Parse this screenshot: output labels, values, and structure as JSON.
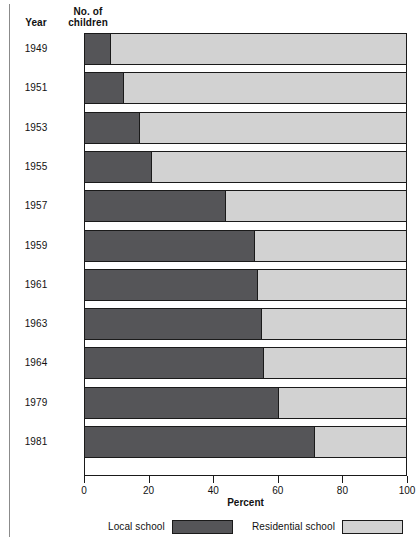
{
  "table_headers": {
    "year": "Year",
    "count_line1": "No. of",
    "count_line2": "children"
  },
  "axis": {
    "title": "Percent",
    "ticks": [
      "0",
      "20",
      "40",
      "60",
      "80",
      "100"
    ]
  },
  "legend": {
    "local_label": "Local school",
    "residential_label": "Residential school"
  },
  "colors": {
    "local": "#555558",
    "residential": "#d2d2d2",
    "outline": "#1a1a1a",
    "background": "#ffffff"
  },
  "rows": [
    {
      "year": "1949",
      "children": "5,818",
      "local": 8.0,
      "residential": 92.0
    },
    {
      "year": "1951",
      "children": "5,676",
      "local": 12.0,
      "residential": 88.0
    },
    {
      "year": "1953",
      "children": "6,284",
      "local": 17.0,
      "residential": 83.0
    },
    {
      "year": "1955",
      "children": "7,333",
      "local": 21.0,
      "residential": 79.0
    },
    {
      "year": "1957",
      "children": "11,157",
      "local": 44.0,
      "residential": 56.0
    },
    {
      "year": "1959",
      "children": "13,375",
      "local": 53.0,
      "residential": 47.0
    },
    {
      "year": "1961",
      "children": "15,802",
      "local": 54.0,
      "residential": 46.0
    },
    {
      "year": "1963",
      "children": "17,091",
      "local": 55.0,
      "residential": 45.0
    },
    {
      "year": "1964",
      "children": "17,852",
      "local": 55.7,
      "residential": 44.3
    },
    {
      "year": "1979",
      "children": "31,161",
      "local": 60.5,
      "residential": 39.5
    },
    {
      "year": "1981",
      "children": "34,050",
      "local": 71.5,
      "residential": 28.5
    }
  ],
  "chart_data": {
    "type": "bar",
    "orientation": "horizontal",
    "stacked": true,
    "normalized": true,
    "title": "",
    "xlabel": "Percent",
    "ylabel": "Year",
    "xlim": [
      0,
      100
    ],
    "xticks": [
      0,
      20,
      40,
      60,
      80,
      100
    ],
    "grid": false,
    "legend_position": "bottom",
    "categories": [
      "1949",
      "1951",
      "1953",
      "1955",
      "1957",
      "1959",
      "1961",
      "1963",
      "1964",
      "1979",
      "1981"
    ],
    "extra_column": {
      "name": "No. of children",
      "values": [
        5818,
        5676,
        6284,
        7333,
        11157,
        13375,
        15802,
        17091,
        17852,
        31161,
        34050
      ]
    },
    "series": [
      {
        "name": "Local school",
        "color": "#555558",
        "values": [
          8.0,
          12.0,
          17.0,
          21.0,
          44.0,
          53.0,
          54.0,
          55.0,
          55.7,
          60.5,
          71.5
        ]
      },
      {
        "name": "Residential school",
        "color": "#d2d2d2",
        "values": [
          92.0,
          88.0,
          83.0,
          79.0,
          56.0,
          47.0,
          46.0,
          45.0,
          44.3,
          39.5,
          28.5
        ]
      }
    ]
  }
}
